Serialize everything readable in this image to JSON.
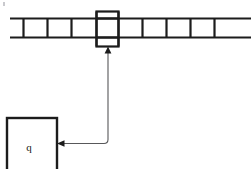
{
  "figure": {
    "kind": "turing-machine-diagram",
    "width": 251,
    "height": 169,
    "background_color": "#ffffff",
    "line_color": "#1c1c1c",
    "connector_color": "#58585a"
  },
  "tape": {
    "name": "tape",
    "description": "Horizontal infinite tape divided into cells",
    "x_start": 10,
    "x_end": 251,
    "top_y": 18,
    "bottom_y": 38,
    "cell_count": 11,
    "cell_contents": [
      "",
      "",
      "",
      "",
      "",
      "",
      "",
      "",
      "",
      "",
      ""
    ],
    "divider_positions": [
      23,
      47,
      71,
      96,
      118,
      142,
      166,
      190,
      214,
      238
    ],
    "line_width": 2.2
  },
  "head": {
    "name": "read-write-head",
    "label": "",
    "x": 96,
    "y": 11,
    "width": 22,
    "height": 35,
    "line_width": 2.2
  },
  "state_box": {
    "name": "state-control-box",
    "label": "q",
    "x": 6,
    "y": 117,
    "width": 51,
    "height": 54,
    "line_width": 2.4,
    "label_x": 28,
    "label_y": 148
  },
  "connector": {
    "name": "head-state-connector",
    "description": "Line from state box right edge going right, then up to the head with arrowheads at both ends",
    "from_x": 58,
    "from_y": 143,
    "corner_x": 108,
    "corner_y": 143,
    "to_x": 108,
    "to_y": 47,
    "arrow_up_label": "arrow-up-to-head",
    "arrow_left_label": "arrow-left-to-state-box",
    "line_width": 1.1
  },
  "artifacts": {
    "speck_top_left": {
      "x": 3,
      "y": 2,
      "w": 2,
      "h": 4
    }
  }
}
